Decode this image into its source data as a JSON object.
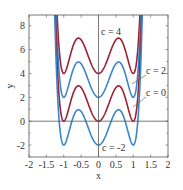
{
  "chart_data": {
    "type": "line",
    "title": "",
    "xlabel": "x",
    "ylabel": "y",
    "xlim": [
      -2,
      2
    ],
    "ylim": [
      -3,
      8.9
    ],
    "xticks": [
      -2,
      -1.5,
      -1,
      -0.5,
      0,
      0.5,
      1,
      1.5,
      2
    ],
    "xtick_labels": [
      "-2",
      "-1.5",
      "-1",
      "-0.5",
      "0",
      "0.5",
      "1",
      "1.5",
      "2"
    ],
    "yticks": [
      -2,
      0,
      2,
      4,
      6,
      8
    ],
    "ytick_labels": [
      "-2",
      "0",
      "2",
      "4",
      "6",
      "8"
    ],
    "grid": false,
    "zero_lines": true,
    "function": "y = c + 20*x^2*(x^2-1)^2",
    "series": [
      {
        "name": "c = 4",
        "c": 4,
        "color": "#9b2335",
        "label": "c = 4",
        "label_pos": [
          101,
          35
        ]
      },
      {
        "name": "c = 2",
        "c": 2,
        "color": "#3a86c8",
        "label": "c = 2",
        "label_pos": [
          146,
          74
        ],
        "leader": [
          [
            146,
            75
          ],
          [
            132,
            84
          ]
        ]
      },
      {
        "name": "c = 0",
        "c": 0,
        "color": "#9b2335",
        "label": "c = 0",
        "label_pos": [
          146,
          96
        ],
        "leader": [
          [
            146,
            97
          ],
          [
            133,
            107
          ]
        ]
      },
      {
        "name": "c = -2",
        "c": -2,
        "color": "#3a86c8",
        "label": "c = -2",
        "label_pos": [
          102,
          151
        ]
      }
    ]
  },
  "colors": {
    "axis": "#555555",
    "zero_line": "#555555",
    "red": "#9b2335",
    "blue": "#3a86c8"
  }
}
